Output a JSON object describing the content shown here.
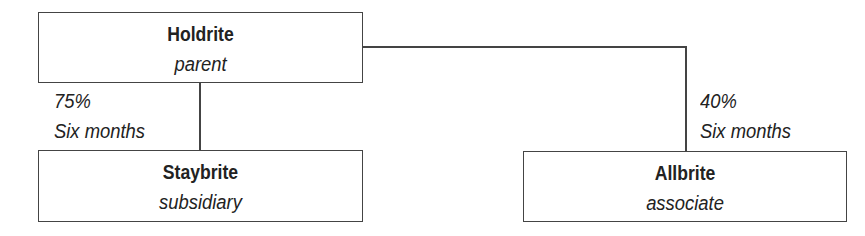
{
  "diagram": {
    "type": "group-structure",
    "nodes": [
      {
        "id": "holdrite",
        "name": "Holdrite",
        "role": "parent"
      },
      {
        "id": "staybrite",
        "name": "Staybrite",
        "role": "subsidiary"
      },
      {
        "id": "allbrite",
        "name": "Allbrite",
        "role": "associate"
      }
    ],
    "edges": [
      {
        "from": "holdrite",
        "to": "staybrite",
        "holding": "75%",
        "period": "Six months"
      },
      {
        "from": "holdrite",
        "to": "allbrite",
        "holding": "40%",
        "period": "Six months"
      }
    ],
    "colors": {
      "line": "#444444",
      "text": "#222222",
      "background": "#ffffff"
    }
  }
}
